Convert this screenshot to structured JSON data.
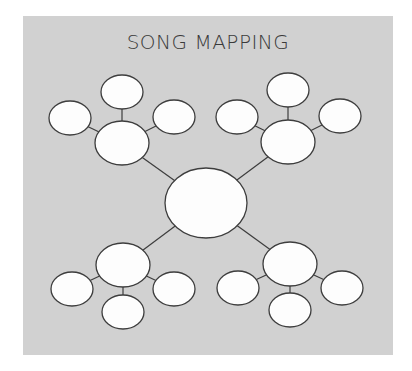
{
  "title": "SONG MAPPING",
  "colors": {
    "background": "#ffffff",
    "panel": "#d1d1d1",
    "node_fill": "#fdfdfd",
    "stroke": "#3d3d3d",
    "title": "#3a3a3a"
  },
  "diagram": {
    "center": {
      "id": "center",
      "cx": 206,
      "cy": 203,
      "rx": 41,
      "ry": 35
    },
    "hubs": [
      {
        "id": "hub-top-left",
        "cx": 122,
        "cy": 143,
        "rx": 27,
        "ry": 22,
        "leaves": [
          {
            "id": "tl-top",
            "cx": 122,
            "cy": 92
          },
          {
            "id": "tl-left",
            "cx": 70,
            "cy": 118
          },
          {
            "id": "tl-right",
            "cx": 174,
            "cy": 117
          }
        ]
      },
      {
        "id": "hub-top-right",
        "cx": 288,
        "cy": 142,
        "rx": 27,
        "ry": 22,
        "leaves": [
          {
            "id": "tr-top",
            "cx": 288,
            "cy": 90
          },
          {
            "id": "tr-left",
            "cx": 237,
            "cy": 117
          },
          {
            "id": "tr-right",
            "cx": 340,
            "cy": 116
          }
        ]
      },
      {
        "id": "hub-bottom-left",
        "cx": 123,
        "cy": 265,
        "rx": 27,
        "ry": 22,
        "leaves": [
          {
            "id": "bl-left",
            "cx": 72,
            "cy": 289
          },
          {
            "id": "bl-right",
            "cx": 174,
            "cy": 289
          },
          {
            "id": "bl-bottom",
            "cx": 123,
            "cy": 312
          }
        ]
      },
      {
        "id": "hub-bottom-right",
        "cx": 290,
        "cy": 264,
        "rx": 27,
        "ry": 22,
        "leaves": [
          {
            "id": "br-left",
            "cx": 238,
            "cy": 288
          },
          {
            "id": "br-right",
            "cx": 342,
            "cy": 288
          },
          {
            "id": "br-bottom",
            "cx": 290,
            "cy": 310
          }
        ]
      }
    ],
    "leaf_rx": 21,
    "leaf_ry": 17
  }
}
